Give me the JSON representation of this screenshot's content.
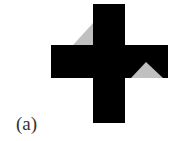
{
  "figure": {
    "label": "(a)",
    "shape": "cross",
    "colors": {
      "cross": "#000000",
      "highlight": "#c0c0c0",
      "background": "#ffffff"
    },
    "cross": {
      "vertical_bar": {
        "x": 93,
        "y": 4,
        "width": 32,
        "height": 119
      },
      "horizontal_bar": {
        "x": 51,
        "y": 45,
        "width": 117,
        "height": 33
      }
    },
    "grey_triangles": [
      {
        "name": "upper-left",
        "points": "93,23 73,45 93,45"
      },
      {
        "name": "lower-right",
        "points": "146,62 131,78 163,78"
      }
    ]
  }
}
